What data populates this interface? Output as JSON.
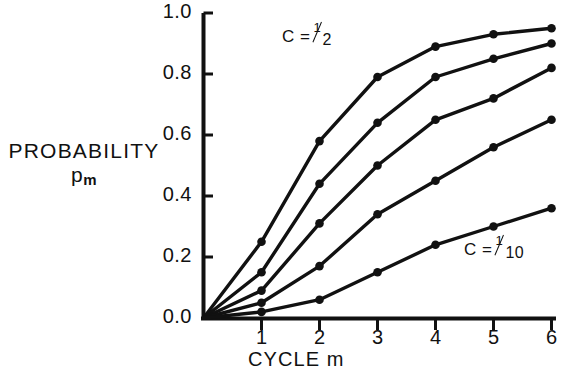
{
  "axes": {
    "y_axis_label_line1": "PROBABILITY",
    "y_axis_label_line2_base": "p",
    "y_axis_label_line2_sub": "m",
    "x_axis_label": "CYCLE m",
    "y_ticks": [
      "1.0",
      "0.8",
      "0.6",
      "0.4",
      "0.2",
      "0.0"
    ],
    "x_ticks": [
      "1",
      "2",
      "3",
      "4",
      "5",
      "6"
    ]
  },
  "annotations": [
    {
      "id": "top-curve-label",
      "prefix": "C =",
      "numerator": "1",
      "denominator": "2"
    },
    {
      "id": "bottom-curve-label",
      "prefix": "C =",
      "numerator": "1",
      "denominator": "10"
    }
  ],
  "style": {
    "line_color": "#111111",
    "marker_color": "#111111",
    "axis_color": "#111111",
    "background": "#ffffff"
  },
  "chart_data": {
    "type": "line",
    "title": "",
    "xlabel": "CYCLE m",
    "ylabel": "PROBABILITY p_m",
    "xlim": [
      0,
      6
    ],
    "ylim": [
      0.0,
      1.0
    ],
    "grid": false,
    "legend": "inline-annotation",
    "x": [
      0,
      1,
      2,
      3,
      4,
      5,
      6
    ],
    "series": [
      {
        "name": "C = 1/2",
        "c_value": 0.5,
        "values": [
          0.0,
          0.25,
          0.58,
          0.79,
          0.89,
          0.93,
          0.95
        ]
      },
      {
        "name": "C = 2/5",
        "c_value": 0.4,
        "values": [
          0.0,
          0.15,
          0.44,
          0.64,
          0.79,
          0.85,
          0.9
        ]
      },
      {
        "name": "C = 3/10",
        "c_value": 0.3,
        "values": [
          0.0,
          0.09,
          0.31,
          0.5,
          0.65,
          0.72,
          0.82
        ]
      },
      {
        "name": "C = 1/5",
        "c_value": 0.2,
        "values": [
          0.0,
          0.05,
          0.17,
          0.34,
          0.45,
          0.56,
          0.65
        ]
      },
      {
        "name": "C = 1/10",
        "c_value": 0.1,
        "values": [
          0.0,
          0.02,
          0.06,
          0.15,
          0.24,
          0.3,
          0.36
        ]
      }
    ]
  }
}
